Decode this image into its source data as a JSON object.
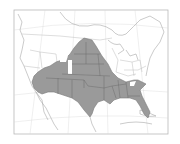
{
  "map": {
    "type": "species-range-map",
    "region": "North America (United States, southern Canada, northern Mexico)",
    "colors": {
      "range_fill": "#9a9a9a",
      "background": "#ffffff",
      "lines": "#a8a8a8"
    },
    "shaded_range": {
      "description": "Great Plains, Southwest, Texas and Gulf Coast states",
      "areas": [
        "Dakotas",
        "Nebraska",
        "Kansas",
        "Oklahoma",
        "Texas",
        "New Mexico",
        "Arizona",
        "Colorado",
        "Missouri",
        "Arkansas",
        "Louisiana",
        "Mississippi",
        "Alabama",
        "Georgia",
        "Florida",
        "South Carolina"
      ]
    },
    "labels": []
  }
}
